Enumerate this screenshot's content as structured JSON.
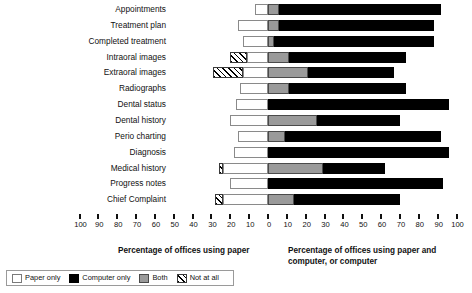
{
  "chart_data": {
    "type": "bar",
    "subtype": "stacked-horizontal-diverging",
    "title": "",
    "xlabel_left": "Percentage of offices using paper",
    "xlabel_right": "Percentage of offices using paper and computer, or computer",
    "ylabel": "",
    "xlim": [
      -100,
      100
    ],
    "xticks": [
      100,
      90,
      80,
      70,
      60,
      50,
      40,
      30,
      20,
      10,
      0,
      10,
      20,
      30,
      40,
      50,
      60,
      70,
      80,
      90,
      100
    ],
    "grid": false,
    "legend_position": "bottom-left",
    "categories": [
      "Appointments",
      "Treatment plan",
      "Completed treatment",
      "Intraoral images",
      "Extraoral images",
      "Radiographs",
      "Dental status",
      "Dental history",
      "Perio charting",
      "Diagnosis",
      "Medical history",
      "Progress notes",
      "Chief Complaint"
    ],
    "series": [
      {
        "name": "Not at all",
        "color": "#hatch",
        "side": "left",
        "values": [
          0,
          0,
          0,
          9,
          16,
          0,
          0,
          0,
          0,
          0,
          2,
          0,
          4
        ]
      },
      {
        "name": "Paper only",
        "color": "#ffffff",
        "side": "left",
        "values": [
          7,
          16,
          13,
          11,
          13,
          15,
          17,
          20,
          16,
          18,
          24,
          20,
          24
        ]
      },
      {
        "name": "Both",
        "color": "#9a9a9a",
        "side": "right",
        "values": [
          6,
          6,
          3,
          11,
          21,
          11,
          0,
          26,
          9,
          0,
          29,
          0,
          14
        ]
      },
      {
        "name": "Computer only",
        "color": "#000000",
        "side": "right",
        "values": [
          92,
          88,
          88,
          73,
          67,
          73,
          96,
          70,
          92,
          96,
          62,
          93,
          70
        ]
      }
    ],
    "legend": [
      {
        "label": "Paper only",
        "swatch": "paper"
      },
      {
        "label": "Computer only",
        "swatch": "computer"
      },
      {
        "label": "Both",
        "swatch": "both"
      },
      {
        "label": "Not at all",
        "swatch": "none"
      }
    ]
  }
}
